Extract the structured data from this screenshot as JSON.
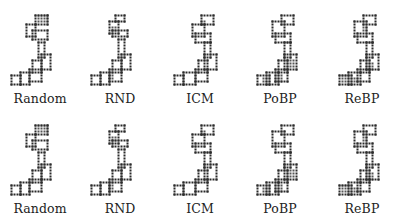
{
  "figure": {
    "rows": [
      {
        "panels": [
          {
            "label": "Random",
            "variant": "a"
          },
          {
            "label": "RND",
            "variant": "b"
          },
          {
            "label": "ICM",
            "variant": "c"
          },
          {
            "label": "PoBP",
            "variant": "d"
          },
          {
            "label": "ReBP",
            "variant": "e"
          }
        ]
      },
      {
        "panels": [
          {
            "label": "Random",
            "variant": "a"
          },
          {
            "label": "RND",
            "variant": "b"
          },
          {
            "label": "ICM",
            "variant": "c"
          },
          {
            "label": "PoBP",
            "variant": "d"
          },
          {
            "label": "ReBP",
            "variant": "e"
          }
        ]
      }
    ],
    "cell_px": 3,
    "ink_color": "#2a2a2a",
    "fill_color": "#555555",
    "light_fill": "#9a9a9a",
    "maps": {
      "a": {
        "offset": [
          0,
          0
        ],
        "rooms": [
          [
            8,
            0,
            5,
            4
          ],
          [
            5,
            3,
            4,
            5
          ],
          [
            7,
            5,
            6,
            4
          ],
          [
            9,
            9,
            3,
            6
          ],
          [
            10,
            13,
            4,
            6
          ],
          [
            7,
            15,
            4,
            5
          ],
          [
            6,
            18,
            5,
            5
          ],
          [
            3,
            19,
            4,
            5
          ],
          [
            0,
            20,
            4,
            4
          ]
        ],
        "filled": [
          [
            9,
            0,
            4,
            3
          ]
        ]
      },
      "b": {
        "offset": [
          0,
          0
        ],
        "rooms": [
          [
            8,
            0,
            4,
            3
          ],
          [
            6,
            2,
            4,
            5
          ],
          [
            7,
            5,
            6,
            3
          ],
          [
            9,
            8,
            3,
            7
          ],
          [
            10,
            13,
            4,
            6
          ],
          [
            7,
            15,
            4,
            5
          ],
          [
            6,
            18,
            5,
            5
          ],
          [
            3,
            19,
            4,
            5
          ],
          [
            0,
            20,
            4,
            4
          ]
        ],
        "filled": [
          [
            7,
            4,
            2,
            2
          ],
          [
            6,
            20,
            2,
            2
          ]
        ]
      },
      "c": {
        "offset": [
          0,
          0
        ],
        "rooms": [
          [
            10,
            0,
            5,
            4
          ],
          [
            7,
            3,
            5,
            5
          ],
          [
            8,
            6,
            6,
            4
          ],
          [
            11,
            9,
            3,
            6
          ],
          [
            11,
            13,
            5,
            6
          ],
          [
            9,
            15,
            4,
            5
          ],
          [
            8,
            18,
            5,
            5
          ],
          [
            4,
            19,
            5,
            5
          ],
          [
            1,
            20,
            4,
            4
          ]
        ],
        "filled": [
          [
            10,
            2,
            2,
            2
          ]
        ]
      },
      "d": {
        "offset": [
          0,
          0
        ],
        "rooms": [
          [
            10,
            0,
            5,
            4
          ],
          [
            7,
            2,
            5,
            6
          ],
          [
            8,
            6,
            6,
            4
          ],
          [
            11,
            9,
            3,
            6
          ],
          [
            11,
            13,
            5,
            6
          ],
          [
            9,
            15,
            4,
            5
          ],
          [
            8,
            18,
            5,
            5
          ],
          [
            5,
            19,
            5,
            5
          ],
          [
            2,
            20,
            5,
            4
          ]
        ],
        "filled": [
          [
            12,
            15,
            3,
            3
          ],
          [
            8,
            20,
            3,
            3
          ],
          [
            4,
            21,
            3,
            2
          ]
        ]
      },
      "e": {
        "offset": [
          0,
          0
        ],
        "rooms": [
          [
            10,
            0,
            5,
            4
          ],
          [
            7,
            2,
            5,
            6
          ],
          [
            8,
            6,
            6,
            4
          ],
          [
            11,
            9,
            3,
            6
          ],
          [
            11,
            13,
            5,
            6
          ],
          [
            9,
            15,
            4,
            5
          ],
          [
            8,
            18,
            5,
            5
          ],
          [
            5,
            19,
            5,
            5
          ],
          [
            2,
            20,
            5,
            4
          ]
        ],
        "filled": [
          [
            10,
            4,
            2,
            2
          ],
          [
            11,
            16,
            3,
            3
          ],
          [
            3,
            20,
            3,
            3
          ],
          [
            6,
            21,
            3,
            2
          ]
        ]
      }
    }
  }
}
